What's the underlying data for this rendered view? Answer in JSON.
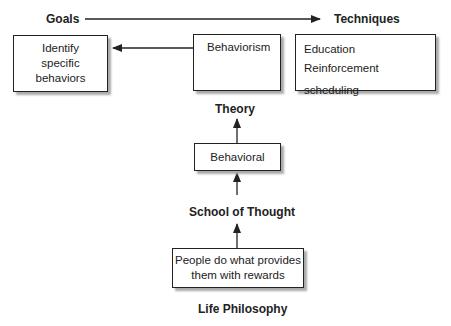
{
  "diagram": {
    "labels": {
      "goals": "Goals",
      "techniques": "Techniques",
      "theory": "Theory",
      "school_of_thought": "School of Thought",
      "life_philosophy": "Life Philosophy"
    },
    "boxes": {
      "goals_box": [
        "Identify",
        "specific",
        "behaviors"
      ],
      "theory_box": "Behaviorism",
      "techniques_box": [
        "Education",
        "Reinforcement scheduling"
      ],
      "school_box": "Behavioral",
      "philosophy_box": [
        "People do what provides",
        "them with rewards"
      ]
    },
    "edges": [
      {
        "from": "Goals",
        "to": "Techniques"
      },
      {
        "from": "Behaviorism",
        "to": "Identify specific behaviors"
      },
      {
        "from": "Behavioral",
        "to": "Theory"
      },
      {
        "from": "School of Thought",
        "to": "Behavioral"
      },
      {
        "from": "People do what provides them with rewards",
        "to": "School of Thought"
      }
    ]
  }
}
